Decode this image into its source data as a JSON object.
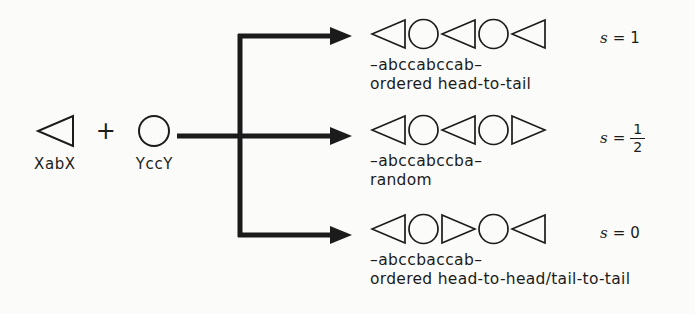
{
  "figure": {
    "background": "#fbfbfa",
    "ink": "#1b1b1b"
  },
  "reactants": {
    "monomer_a": {
      "shape": "triangle-left",
      "label": "XabX"
    },
    "operator": "+",
    "monomer_b": {
      "shape": "circle",
      "label": "YccY"
    }
  },
  "products": [
    {
      "shapes": [
        "triangle-left",
        "circle",
        "triangle-left",
        "circle",
        "triangle-left"
      ],
      "sequence": "–abccabccab–",
      "description": "ordered head-to-tail",
      "s_symbol": "s",
      "s_equals": "=",
      "s_value": "1",
      "s_is_fraction": false,
      "s_numerator": "",
      "s_denominator": ""
    },
    {
      "shapes": [
        "triangle-left",
        "circle",
        "triangle-left",
        "circle",
        "triangle-right"
      ],
      "sequence": "–abccabccba–",
      "description": "random",
      "s_symbol": "s",
      "s_equals": "=",
      "s_value": "",
      "s_is_fraction": true,
      "s_numerator": "1",
      "s_denominator": "2"
    },
    {
      "shapes": [
        "triangle-left",
        "circle",
        "triangle-right",
        "circle",
        "triangle-left"
      ],
      "sequence": "–abccbaccab–",
      "description": "ordered head-to-head/tail-to-tail",
      "s_symbol": "s",
      "s_equals": "=",
      "s_value": "0",
      "s_is_fraction": false,
      "s_numerator": "",
      "s_denominator": ""
    }
  ]
}
